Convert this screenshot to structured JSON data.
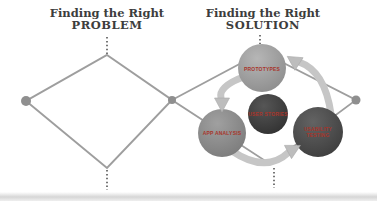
{
  "titles": {
    "problem": {
      "line1": "Finding the Right",
      "line2": "PROBLEM"
    },
    "solution": {
      "line1": "Finding the Right",
      "line2": "SOLUTION"
    }
  },
  "cycle": {
    "nodes": [
      {
        "id": "prototypes",
        "label": "PROTOTYPES",
        "fill": "#9a9a9a"
      },
      {
        "id": "user-stories",
        "label": "USER STORIES",
        "fill": "#3f3f3f"
      },
      {
        "id": "app-analysis",
        "label": "APP ANALYSIS",
        "fill": "#868686"
      },
      {
        "id": "usability-testing",
        "label": "USABILITY TESTING",
        "fill": "#4a4a4a"
      }
    ],
    "label_color": "#a8352b",
    "arrow_color": "#c6c6c6"
  },
  "diagram": {
    "line_color": "#9e9e9e",
    "dot_color": "#8f8f8f",
    "dotted_line_color": "#3c3c3c",
    "title_color": "#3d3d3d",
    "background": "#ffffff"
  }
}
